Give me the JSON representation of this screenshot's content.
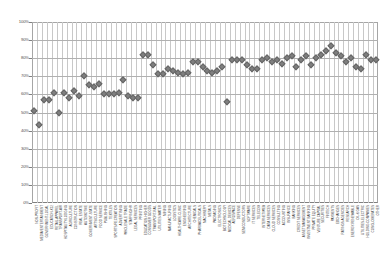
{
  "chart": {
    "title": "",
    "background_color": "#ffffff",
    "marker_color": "#7f7f7f",
    "gridline_color": "#b0b0b0"
  },
  "chart_data": {
    "type": "scatter",
    "title": "",
    "xlabel": "",
    "ylabel": "",
    "ylim": [
      0,
      100
    ],
    "yticks": [
      0,
      10,
      20,
      30,
      40,
      50,
      60,
      70,
      80,
      90,
      100
    ],
    "ytick_labels": [
      "0%",
      "10%",
      "20%",
      "30%",
      "40%",
      "50%",
      "60%",
      "70%",
      "80%",
      "90%",
      "100%"
    ],
    "grid": true,
    "legend": "none",
    "units": "percent",
    "categories": [
      "NON-PROFIT",
      "MEDIA/ENTERTAINMENT",
      "GOVERNMENT-LOCAL",
      "EDUCATION-K12",
      "RETAIL-APPAREL",
      "TRANSPORT-AIR",
      "HOSPITALITY/LODGING",
      "AGRICULTURE",
      "CONSTRUCTION",
      "REAL ESTATE",
      "AUTOMOTIVE",
      "GOVERNMENT-STATE",
      "ARTS/CULTURE",
      "FOOD SERVICE",
      "PUBLISHING",
      "TEXTILES",
      "SPORTS/RECREATION",
      "ADVERTISING",
      "WHOLESALE TRADE",
      "STAFFING/HR",
      "LEGAL SERVICES",
      "PRINTING",
      "EDUCATION-HIGHER",
      "CONSUMER GOODS",
      "TRANSPORT-RAIL",
      "UTILITIES-WATER",
      "MINING",
      "MANUFACTURING",
      "LOGISTICS",
      "HEALTHCARE-CLINIC",
      "ENGINEERING",
      "ARCHITECTURE",
      "CHEMICALS",
      "PHARMACEUTICALS",
      "MACHINERY",
      "METALS",
      "PACKAGING",
      "ELECTRONICS",
      "BIOTECHNOLOGY",
      "MEDICAL DEVICES",
      "AEROSPACE",
      "DEFENSE",
      "SEMICONDUCTORS",
      "SOFTWARE",
      "IT SERVICES",
      "TELECOM",
      "INTERNET/WEB",
      "DATA SERVICES",
      "CLOUD SERVICES",
      "CONSULTING",
      "ACCOUNTING",
      "INSURANCE",
      "BANKING",
      "CREDIT SERVICES",
      "ASSET MANAGEMENT",
      "INVESTMENT BANKING",
      "PRIVATE EQUITY",
      "VENTURE CAPITAL",
      "SECURITIES",
      "FINTECH",
      "PAYMENTS",
      "EXCHANGES",
      "RATINGS AGENCIES",
      "RESEARCH",
      "ENERGY-RENEWABLE",
      "OIL & GAS",
      "UTILITIES-ELECTRIC",
      "HOLDING COMPANIES",
      "CONGLOMERATES",
      "OTHER"
    ],
    "values": [
      51,
      43,
      57,
      57,
      61,
      50,
      61,
      58,
      62,
      59,
      70,
      65,
      64,
      66,
      60,
      60,
      60,
      61,
      68,
      59,
      58,
      58,
      82,
      82,
      76,
      71,
      71,
      74,
      73,
      72,
      71,
      72,
      78,
      78,
      75,
      73,
      72,
      73,
      75,
      56,
      79,
      79,
      79,
      76,
      74,
      74,
      79,
      80,
      78,
      79,
      77,
      80,
      81,
      75,
      79,
      81,
      76,
      80,
      82,
      84,
      87,
      83,
      81,
      78,
      80,
      75,
      74,
      82,
      79,
      79
    ]
  }
}
